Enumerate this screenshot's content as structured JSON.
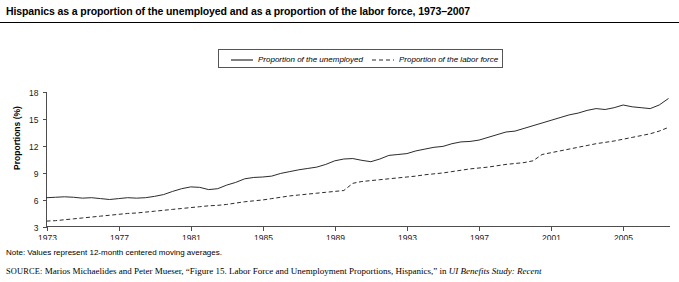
{
  "figure": {
    "title": "Hispanics as a proportion of the unemployed and as a proportion of the labor force, 1973–2007",
    "note": "Note: Values represent 12-month centered moving averages.",
    "source_prefix": "SOURCE:",
    "source_text": "Marios Michaelides and Peter Mueser, “Figure 15. Labor Force and Unemployment Proportions, Hispanics,” in",
    "source_italic": "UI Benefits Study: Recent"
  },
  "legend": {
    "position": "top-center-inside",
    "items": [
      {
        "label": "Proportion of the unemployed",
        "style": "solid",
        "color": "#2b2b2b"
      },
      {
        "label": "Proportion of the labor force",
        "style": "dashed",
        "color": "#2b2b2b"
      }
    ]
  },
  "axes": {
    "y_title": "Proportions (%)",
    "y_ticks": [
      "3",
      "6",
      "9",
      "12",
      "15",
      "18"
    ],
    "x_ticks": [
      "1973",
      "1977",
      "1981",
      "1985",
      "1989",
      "1993",
      "1997",
      "2001",
      "2005"
    ]
  },
  "chart_data": {
    "type": "line",
    "title": "Hispanics as a proportion of the unemployed and as a proportion of the labor force, 1973–2007",
    "xlabel": "",
    "ylabel": "Proportions (%)",
    "xlim": [
      1973,
      2007.6
    ],
    "ylim": [
      3,
      18
    ],
    "grid": false,
    "legend_position": "upper center",
    "x_tick_values": [
      1973,
      1977,
      1981,
      1985,
      1989,
      1993,
      1997,
      2001,
      2005
    ],
    "y_tick_values": [
      3,
      6,
      9,
      12,
      15,
      18
    ],
    "x": [
      1973.0,
      1973.5,
      1974.0,
      1974.5,
      1975.0,
      1975.5,
      1976.0,
      1976.5,
      1977.0,
      1977.5,
      1978.0,
      1978.5,
      1979.0,
      1979.5,
      1980.0,
      1980.5,
      1981.0,
      1981.5,
      1982.0,
      1982.5,
      1983.0,
      1983.5,
      1984.0,
      1984.5,
      1985.0,
      1985.5,
      1986.0,
      1986.5,
      1987.0,
      1987.5,
      1988.0,
      1988.5,
      1989.0,
      1989.5,
      1990.0,
      1990.5,
      1991.0,
      1991.5,
      1992.0,
      1992.5,
      1993.0,
      1993.5,
      1994.0,
      1994.5,
      1995.0,
      1995.5,
      1996.0,
      1996.5,
      1997.0,
      1997.5,
      1998.0,
      1998.5,
      1999.0,
      1999.5,
      2000.0,
      2000.5,
      2001.0,
      2001.5,
      2002.0,
      2002.5,
      2003.0,
      2003.5,
      2004.0,
      2004.5,
      2005.0,
      2005.5,
      2006.0,
      2006.5,
      2007.0,
      2007.5
    ],
    "series": [
      {
        "name": "Proportion of the unemployed",
        "style": "solid",
        "values": [
          6.2,
          6.25,
          6.3,
          6.25,
          6.15,
          6.2,
          6.1,
          6.0,
          6.1,
          6.2,
          6.15,
          6.2,
          6.35,
          6.55,
          6.9,
          7.2,
          7.4,
          7.35,
          7.1,
          7.2,
          7.6,
          7.9,
          8.3,
          8.45,
          8.5,
          8.6,
          8.9,
          9.1,
          9.3,
          9.45,
          9.6,
          9.9,
          10.3,
          10.5,
          10.55,
          10.35,
          10.2,
          10.5,
          10.9,
          11.0,
          11.1,
          11.4,
          11.6,
          11.8,
          11.9,
          12.2,
          12.4,
          12.45,
          12.6,
          12.9,
          13.2,
          13.5,
          13.6,
          13.9,
          14.2,
          14.5,
          14.8,
          15.1,
          15.4,
          15.6,
          15.9,
          16.1,
          16.0,
          16.2,
          16.5,
          16.3,
          16.2,
          16.1,
          16.5,
          17.2
        ]
      },
      {
        "name": "Proportion of the labor force",
        "style": "dashed",
        "values": [
          3.6,
          3.65,
          3.75,
          3.85,
          3.95,
          4.05,
          4.15,
          4.25,
          4.35,
          4.45,
          4.5,
          4.6,
          4.7,
          4.8,
          4.9,
          5.0,
          5.1,
          5.2,
          5.3,
          5.35,
          5.45,
          5.6,
          5.75,
          5.85,
          5.95,
          6.1,
          6.25,
          6.4,
          6.5,
          6.6,
          6.7,
          6.8,
          6.9,
          7.0,
          7.8,
          8.0,
          8.1,
          8.2,
          8.3,
          8.4,
          8.5,
          8.6,
          8.75,
          8.85,
          8.95,
          9.1,
          9.25,
          9.4,
          9.5,
          9.6,
          9.75,
          9.9,
          10.0,
          10.1,
          10.3,
          11.0,
          11.2,
          11.4,
          11.6,
          11.8,
          12.0,
          12.2,
          12.35,
          12.5,
          12.7,
          12.9,
          13.1,
          13.3,
          13.6,
          14.0
        ]
      }
    ]
  }
}
